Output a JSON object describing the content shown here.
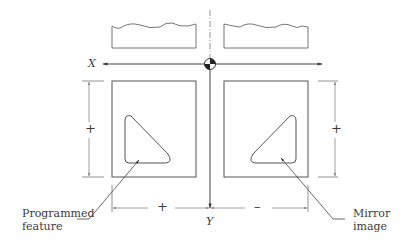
{
  "diagram": {
    "axes": {
      "x_label": "X",
      "y_label": "Y"
    },
    "dimensions": {
      "left_vertical_sign": "+",
      "right_vertical_sign": "+",
      "bottom_left_sign": "+",
      "bottom_right_sign": "–"
    },
    "callouts": {
      "programmed_line1": "Programmed",
      "programmed_line2": "feature",
      "mirror_line1": "Mirror",
      "mirror_line2": "image"
    },
    "colors": {
      "line": "#555555",
      "text": "#3a3a3a",
      "dash": "#888888"
    }
  }
}
